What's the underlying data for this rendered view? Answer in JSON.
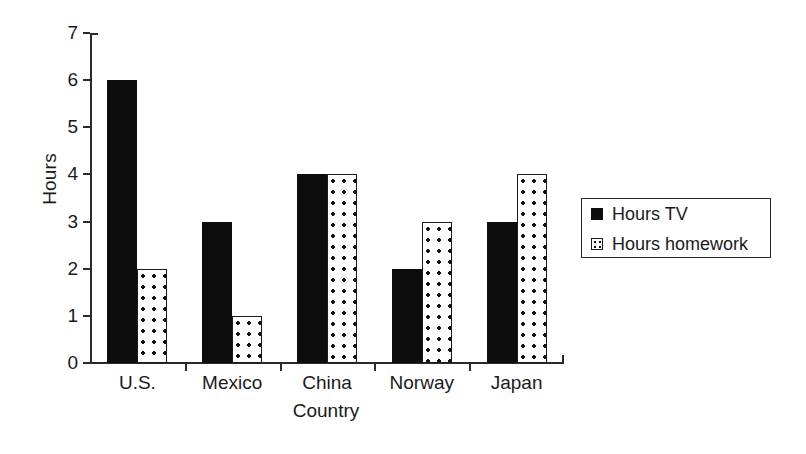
{
  "chart_data": {
    "type": "bar",
    "title": "",
    "subtitle": "",
    "xlabel": "Country",
    "ylabel": "Hours",
    "categories": [
      "U.S.",
      "Mexico",
      "China",
      "Norway",
      "Japan"
    ],
    "series": [
      {
        "name": "Hours TV",
        "values": [
          6,
          3,
          4,
          2,
          3
        ],
        "color": "#0d0d0d",
        "fill": "solid-black"
      },
      {
        "name": "Hours homework",
        "values": [
          2,
          1,
          4,
          3,
          4
        ],
        "color": "#ffffff",
        "fill": "white-dotted"
      }
    ],
    "ylim": [
      0,
      7
    ],
    "ytick_labels": [
      "0",
      "1",
      "2",
      "3",
      "4",
      "5",
      "6",
      "7"
    ],
    "ytick_values": [
      0,
      1,
      2,
      3,
      4,
      5,
      6,
      7
    ],
    "grid": false,
    "legend_position": "right",
    "legend_entries": [
      "Hours TV",
      "Hours homework"
    ]
  },
  "axes": {
    "y_title": "Hours",
    "x_title": "Country"
  },
  "legend": {
    "rows": [
      {
        "label": "Hours TV",
        "swatch": "solid-black-square-icon"
      },
      {
        "label": "Hours homework",
        "swatch": "dotted-white-square-icon"
      }
    ]
  }
}
